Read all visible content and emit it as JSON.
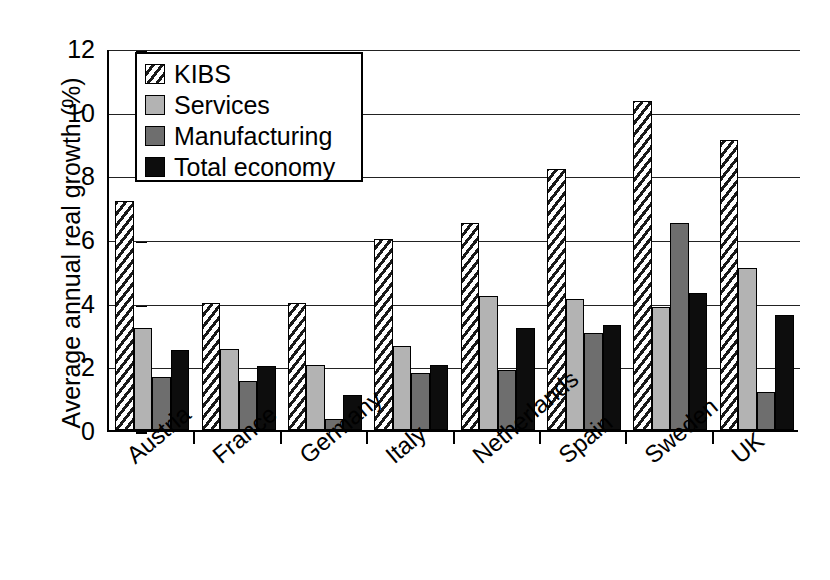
{
  "chart_data": {
    "type": "bar",
    "title": "",
    "subtitle": "",
    "xlabel": "",
    "ylabel": "Average annual real growth (%)",
    "ylim": [
      0,
      12
    ],
    "yticks": [
      0,
      2,
      4,
      6,
      8,
      10,
      12
    ],
    "ytick_labels": [
      "0",
      "2",
      "4",
      "6",
      "8",
      "10",
      "12"
    ],
    "grid": true,
    "grid_axis": "y",
    "legend_position": "upper-left-inside",
    "categories": [
      "Austria",
      "France",
      "Germany",
      "Italy",
      "Netherlands",
      "Spain",
      "Sweden",
      "UK"
    ],
    "series": [
      {
        "name": "KIBS",
        "pattern": "diagonal-hatch",
        "color": "#ffffff",
        "values": [
          7.2,
          4.0,
          4.0,
          6.0,
          6.5,
          8.2,
          10.35,
          9.1
        ]
      },
      {
        "name": "Services",
        "pattern": "solid",
        "color": "#b3b3b3",
        "values": [
          3.2,
          2.55,
          2.05,
          2.65,
          4.2,
          4.1,
          3.85,
          5.1
        ]
      },
      {
        "name": "Manufacturing",
        "pattern": "solid",
        "color": "#6e6e6e",
        "values": [
          1.65,
          1.55,
          0.35,
          1.8,
          1.9,
          3.05,
          6.5,
          1.2
        ]
      },
      {
        "name": "Total economy",
        "pattern": "solid",
        "color": "#0d0d0d",
        "values": [
          2.5,
          2.0,
          1.1,
          2.05,
          3.2,
          3.3,
          4.3,
          3.6
        ]
      }
    ]
  },
  "legend": {
    "items": [
      {
        "label": "KIBS",
        "swatch": "kibs-swatch-icon"
      },
      {
        "label": "Services",
        "swatch": "services-swatch-icon"
      },
      {
        "label": "Manufacturing",
        "swatch": "manufacturing-swatch-icon"
      },
      {
        "label": "Total economy",
        "swatch": "total-economy-swatch-icon"
      }
    ]
  }
}
